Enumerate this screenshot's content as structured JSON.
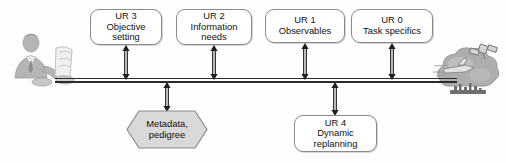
{
  "diagram": {
    "background_color": "#fefefe",
    "line_color": "#2b2b2b",
    "box_border_color": "#8a8a8a",
    "box_fill_color": "#ffffff",
    "hexagon_fill_color": "#d9d9d9",
    "illustration_color": "#a6a6a6"
  },
  "top_nodes": [
    {
      "id": "ur3",
      "line1": "UR 3",
      "line2": "Objective",
      "line3": "setting"
    },
    {
      "id": "ur2",
      "line1": "UR 2",
      "line2": "Information",
      "line3": "needs"
    },
    {
      "id": "ur1",
      "line1": "UR 1",
      "line2": "Observables",
      "line3": ""
    },
    {
      "id": "ur0",
      "line1": "UR 0",
      "line2": "Task specifics",
      "line3": ""
    }
  ],
  "bottom_nodes": [
    {
      "id": "metadata",
      "shape": "hexagon",
      "line1": "Metadata,",
      "line2": "pedigree",
      "line3": ""
    },
    {
      "id": "ur4",
      "shape": "rounded-rect",
      "line1": "UR 4",
      "line2": "Dynamic",
      "line3": "replanning"
    }
  ],
  "illustrations": [
    {
      "id": "analyst",
      "label": "analyst-at-desk"
    },
    {
      "id": "sensors",
      "label": "satellite-aircraft-ships-cloud"
    }
  ],
  "connectors": [
    {
      "id": "ur3-link",
      "type": "double-headed-arrow"
    },
    {
      "id": "ur2-link",
      "type": "double-headed-arrow"
    },
    {
      "id": "ur1-link",
      "type": "double-headed-arrow"
    },
    {
      "id": "ur0-link",
      "type": "double-headed-arrow"
    },
    {
      "id": "metadata-link",
      "type": "double-headed-arrow"
    },
    {
      "id": "ur4-link",
      "type": "double-headed-arrow"
    },
    {
      "id": "main-bus",
      "type": "double-rail-line"
    }
  ]
}
